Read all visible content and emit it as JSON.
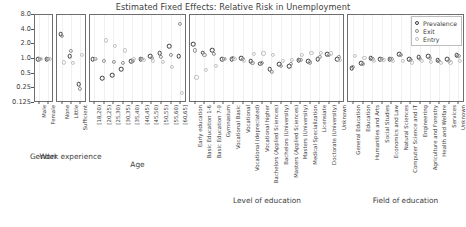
{
  "chart_data": {
    "type": "scatter",
    "title": "Estimated Fixed Effects: Relative Risk in Unemployment",
    "xlabel": "",
    "ylabel": "",
    "yscale": "log2",
    "yticks": [
      "8.0",
      "4.0",
      "2.0",
      "1.0",
      "0.5",
      "0.25",
      "0.125"
    ],
    "ylim": [
      0.125,
      8.0
    ],
    "grid": true,
    "legend_position": "top-right",
    "legend": [
      "Prevalence",
      "Exit",
      "Entry"
    ],
    "series_colors": {
      "Prevalence": "#3b3b3b",
      "Exit": "#8f8f8f",
      "Entry": "#c0c0c0"
    },
    "panels": [
      {
        "name": "Gender",
        "categories": [
          "Male",
          "Female"
        ],
        "series": [
          {
            "name": "Prevalence",
            "values": [
              1.0,
              1.0
            ]
          },
          {
            "name": "Exit",
            "values": [
              1.0,
              1.0
            ]
          },
          {
            "name": "Entry",
            "values": [
              1.0,
              1.0
            ]
          }
        ]
      },
      {
        "name": "Work experience",
        "categories": [
          "None",
          "Little",
          "Sufficient"
        ],
        "series": [
          {
            "name": "Prevalence",
            "values": [
              3.2,
              1.15,
              0.3
            ]
          },
          {
            "name": "Exit",
            "values": [
              3.0,
              1.45,
              0.24
            ]
          },
          {
            "name": "Entry",
            "values": [
              0.85,
              0.82,
              1.2
            ]
          }
        ]
      },
      {
        "name": "Age",
        "categories": [
          "[18,20)",
          "[20,25)",
          "[25,30)",
          "[30,35)",
          "[35,40)",
          "[40,45)",
          "[45,50)",
          "[50,55)",
          "[55,60)",
          "[60,65]"
        ],
        "series": [
          {
            "name": "Prevalence",
            "values": [
              1.0,
              0.4,
              0.47,
              0.62,
              0.9,
              1.0,
              1.15,
              1.3,
              1.85,
              1.15
            ]
          },
          {
            "name": "Exit",
            "values": [
              1.0,
              0.9,
              0.87,
              0.82,
              0.9,
              1.0,
              1.05,
              1.1,
              1.2,
              5.2
            ]
          },
          {
            "name": "Entry",
            "values": [
              1.0,
              2.4,
              1.85,
              1.5,
              1.0,
              0.95,
              0.9,
              0.88,
              0.68,
              0.2
            ]
          }
        ]
      },
      {
        "name": "Level of education",
        "categories": [
          "Early education",
          "Basic Education 1-6",
          "Basic Education 7-9",
          "Gymnasium",
          "Vocational Basic",
          "Vocational",
          "Vocational (depreciated)",
          "Vocational higher",
          "Bachelors (Applied Sciences)",
          "Bachelors (University)",
          "Masters (Applied Sciences)",
          "Masters (University)",
          "Medical Specialization",
          "Licensiate",
          "Doctorate (University)",
          "Unknown"
        ],
        "series": [
          {
            "name": "Prevalence",
            "values": [
              2.0,
              1.35,
              1.5,
              1.0,
              1.0,
              1.05,
              0.9,
              0.8,
              0.62,
              0.78,
              0.72,
              0.95,
              0.9,
              1.0,
              1.25,
              1.0
            ]
          },
          {
            "name": "Exit",
            "values": [
              1.5,
              1.2,
              1.25,
              1.0,
              1.05,
              1.0,
              0.82,
              0.82,
              0.55,
              0.72,
              0.8,
              0.95,
              0.85,
              1.1,
              1.2,
              1.1
            ]
          },
          {
            "name": "Entry",
            "values": [
              0.42,
              0.6,
              0.72,
              1.0,
              1.0,
              0.9,
              1.25,
              1.3,
              1.2,
              0.9,
              0.95,
              1.2,
              1.35,
              1.35,
              1.3,
              0.95
            ]
          }
        ]
      },
      {
        "name": "Field of education",
        "categories": [
          "General Education",
          "Education",
          "Humanities and Arts",
          "Social Studies",
          "Economics and Law",
          "Natural Sciences",
          "Computer Science and IT",
          "Engineering",
          "Agriculture and Forestry",
          "Health and Welfare",
          "Services",
          "Unknown"
        ],
        "series": [
          {
            "name": "Prevalence",
            "values": [
              0.65,
              0.82,
              1.05,
              1.0,
              1.0,
              1.25,
              1.0,
              1.1,
              1.15,
              0.95,
              1.0,
              1.2
            ]
          },
          {
            "name": "Exit",
            "values": [
              0.7,
              0.8,
              1.0,
              1.0,
              1.0,
              1.2,
              0.95,
              1.0,
              1.05,
              0.9,
              0.9,
              1.15
            ]
          },
          {
            "name": "Entry",
            "values": [
              1.15,
              1.05,
              0.92,
              0.95,
              0.9,
              0.9,
              0.85,
              0.9,
              0.88,
              0.82,
              0.85,
              0.9
            ]
          }
        ]
      }
    ]
  }
}
